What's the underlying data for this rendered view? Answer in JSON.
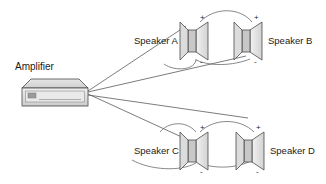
{
  "diagram": {
    "amplifier": {
      "label": "Amplifier",
      "icon": "amplifier-icon"
    },
    "terminals": {
      "positive": "+",
      "negative": "-"
    },
    "speakers": [
      {
        "id": "a",
        "label": "Speaker A",
        "label_side": "left",
        "icon": "speaker-icon"
      },
      {
        "id": "b",
        "label": "Speaker B",
        "label_side": "right",
        "icon": "speaker-icon"
      },
      {
        "id": "c",
        "label": "Speaker C",
        "label_side": "left",
        "icon": "speaker-icon"
      },
      {
        "id": "d",
        "label": "Speaker D",
        "label_side": "right",
        "icon": "speaker-icon"
      }
    ],
    "colors": {
      "background": "#ffffff",
      "wire": "#5a5a5a",
      "outline": "#4a4a4a",
      "text": "#1a1a1a",
      "amp_top": "#d9d9d9",
      "amp_front": "#e4e4e4",
      "amp_side": "#b8b8b8",
      "speaker_body": "#cfcfcf",
      "speaker_cone": "#e0e0e0"
    }
  }
}
